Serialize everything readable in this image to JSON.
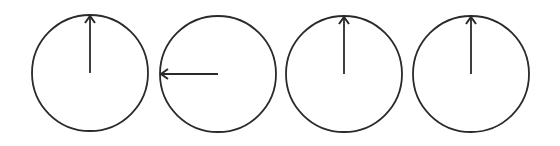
{
  "diagram": {
    "type": "dial-arrows",
    "stroke_color": "#2a2a2a",
    "background": "#ffffff",
    "radius": 58,
    "dials": [
      {
        "id": 1,
        "cx": 90,
        "cy": 73,
        "direction": "up"
      },
      {
        "id": 2,
        "cx": 218,
        "cy": 74,
        "direction": "left"
      },
      {
        "id": 3,
        "cx": 344,
        "cy": 74,
        "direction": "up"
      },
      {
        "id": 4,
        "cx": 471,
        "cy": 74,
        "direction": "up"
      }
    ]
  }
}
